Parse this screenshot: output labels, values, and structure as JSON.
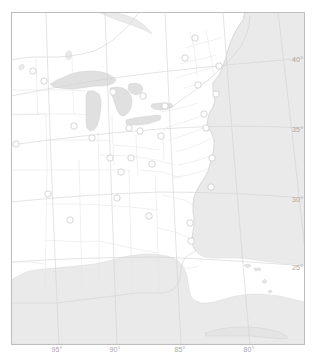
{
  "map": {
    "title": "Eastern North America reference map",
    "projection": "conic",
    "frame": {
      "x": 11,
      "y": 12,
      "width": 294,
      "height": 333
    },
    "colors": {
      "frame_border": "#b9b9b9",
      "land_outline": "#d8d8d8",
      "state_border": "#e2e2e2",
      "water_fill": "#e9e9e9",
      "water_outline": "#d2d2d2",
      "graticule": "#cfcfcf",
      "marker_stroke": "#d0d0d0",
      "marker_fill": "#ffffff",
      "label_text": "#a8a8a8",
      "page_background": "#ffffff"
    },
    "latitude_axis": {
      "side": "right",
      "labels": [
        {
          "text": "40°",
          "x": 292,
          "y": 60
        },
        {
          "text": "35°",
          "x": 292,
          "y": 130
        },
        {
          "text": "30°",
          "x": 292,
          "y": 200
        },
        {
          "text": "25°",
          "x": 292,
          "y": 268
        }
      ]
    },
    "longitude_axis": {
      "side": "bottom",
      "labels": [
        {
          "text": "95°",
          "x": 57,
          "y": 350
        },
        {
          "text": "90°",
          "x": 115,
          "y": 350
        },
        {
          "text": "85°",
          "x": 180,
          "y": 350
        },
        {
          "text": "80°",
          "x": 249,
          "y": 350
        }
      ]
    },
    "markers": [
      {
        "id": "m01",
        "x": 44,
        "y": 81
      },
      {
        "id": "m02",
        "x": 33,
        "y": 71
      },
      {
        "id": "m03",
        "x": 113,
        "y": 92
      },
      {
        "id": "m04",
        "x": 143,
        "y": 96
      },
      {
        "id": "m05",
        "x": 165,
        "y": 106
      },
      {
        "id": "m06",
        "x": 195,
        "y": 38
      },
      {
        "id": "m07",
        "x": 185,
        "y": 58
      },
      {
        "id": "m08",
        "x": 219,
        "y": 66
      },
      {
        "id": "m09",
        "x": 198,
        "y": 85
      },
      {
        "id": "m10",
        "x": 216,
        "y": 94
      },
      {
        "id": "m11",
        "x": 204,
        "y": 114
      },
      {
        "id": "m12",
        "x": 206,
        "y": 128
      },
      {
        "id": "m13",
        "x": 74,
        "y": 126
      },
      {
        "id": "m14",
        "x": 92,
        "y": 138
      },
      {
        "id": "m15",
        "x": 129,
        "y": 128
      },
      {
        "id": "m16",
        "x": 140,
        "y": 131
      },
      {
        "id": "m17",
        "x": 161,
        "y": 136
      },
      {
        "id": "m18",
        "x": 16,
        "y": 144
      },
      {
        "id": "m19",
        "x": 110,
        "y": 158
      },
      {
        "id": "m20",
        "x": 131,
        "y": 158
      },
      {
        "id": "m21",
        "x": 152,
        "y": 164
      },
      {
        "id": "m22",
        "x": 121,
        "y": 172
      },
      {
        "id": "m23",
        "x": 212,
        "y": 158
      },
      {
        "id": "m24",
        "x": 48,
        "y": 194
      },
      {
        "id": "m25",
        "x": 117,
        "y": 198
      },
      {
        "id": "m26",
        "x": 211,
        "y": 187
      },
      {
        "id": "m27",
        "x": 70,
        "y": 220
      },
      {
        "id": "m28",
        "x": 149,
        "y": 216
      },
      {
        "id": "m29",
        "x": 190,
        "y": 223
      },
      {
        "id": "m30",
        "x": 191,
        "y": 241
      }
    ]
  }
}
